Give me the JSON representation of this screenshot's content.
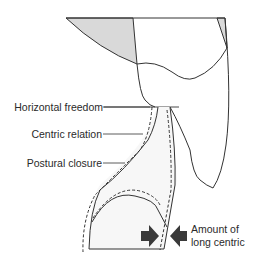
{
  "figure": {
    "labels": {
      "horizontal_freedom": "Horizontal freedom",
      "centric_relation": "Centric relation",
      "postural_closure": "Postural closure",
      "long_centric_line1": "Amount of",
      "long_centric_line2": "long centric"
    },
    "colors": {
      "stroke": "#333333",
      "shade": "#d9d9d9",
      "arrow": "#3a3a3a",
      "text": "#2a2a2a"
    }
  }
}
